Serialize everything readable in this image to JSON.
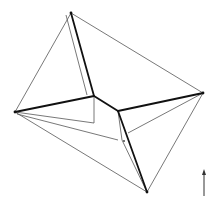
{
  "diagram": {
    "type": "geometric-line-drawing",
    "colors": {
      "background": "#ffffff",
      "thin_line": "#555555",
      "thick_line": "#111111",
      "arrow": "#333333"
    },
    "outer_vertices": {
      "top": [
        71,
        13
      ],
      "left": [
        15,
        112
      ],
      "right": [
        203,
        93
      ],
      "bottom": [
        147,
        192
      ]
    },
    "inner_vertices": {
      "top_left": [
        94,
        96
      ],
      "top_right": [
        118,
        111
      ],
      "bottom_left": [
        94,
        123
      ],
      "bottom_right": [
        122,
        140
      ]
    },
    "thick_edges": [
      [
        [
          71,
          13
        ],
        [
          94,
          96
        ]
      ],
      [
        [
          15,
          112
        ],
        [
          94,
          96
        ]
      ],
      [
        [
          94,
          96
        ],
        [
          118,
          111
        ]
      ],
      [
        [
          118,
          111
        ],
        [
          203,
          93
        ]
      ],
      [
        [
          118,
          111
        ],
        [
          147,
          192
        ]
      ]
    ],
    "thin_edges": [
      [
        [
          71,
          13
        ],
        [
          15,
          112
        ]
      ],
      [
        [
          71,
          13
        ],
        [
          203,
          93
        ]
      ],
      [
        [
          15,
          112
        ],
        [
          147,
          192
        ]
      ],
      [
        [
          203,
          93
        ],
        [
          147,
          192
        ]
      ],
      [
        [
          66,
          15
        ],
        [
          87,
          95
        ]
      ],
      [
        [
          94,
          96
        ],
        [
          94,
          123
        ]
      ],
      [
        [
          118,
          111
        ],
        [
          122,
          140
        ]
      ],
      [
        [
          15,
          112
        ],
        [
          94,
          123
        ]
      ],
      [
        [
          122,
          140
        ],
        [
          147,
          192
        ]
      ],
      [
        [
          17,
          114
        ],
        [
          118,
          140
        ]
      ],
      [
        [
          128,
          133
        ],
        [
          203,
          93
        ]
      ]
    ],
    "marker_dot": [
      124,
      141
    ],
    "arrow": {
      "x": 204,
      "y_start": 196,
      "y_end": 169,
      "direction": "up"
    }
  }
}
